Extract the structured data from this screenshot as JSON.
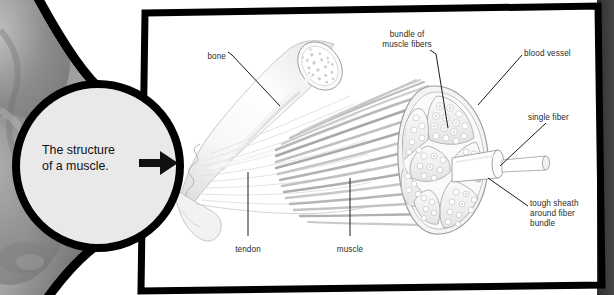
{
  "page": {
    "title": "The structure of a muscle",
    "width": 614,
    "height": 295
  },
  "callout": {
    "text": "The structure\nof a muscle.",
    "arrow_icon": "arrow-right-icon",
    "fill": "#e9e9e9",
    "stroke": "#000000"
  },
  "photo": {
    "alt": "greyscale body photograph",
    "base": "#8e8e8e"
  },
  "frame": {
    "border_color": "#000000",
    "fill": "#ffffff",
    "side_band": "#3c3c3c"
  },
  "diagram": {
    "name": "muscle-anatomy-diagram",
    "labels": [
      {
        "id": "bone",
        "text": "bone",
        "x": 190,
        "y": 52,
        "w": 36,
        "align": "r"
      },
      {
        "id": "bundle",
        "text": "bundle of\nmuscle fibers",
        "x": 368,
        "y": 30,
        "w": 78,
        "align": "c"
      },
      {
        "id": "blood-vessel",
        "text": "blood vessel",
        "x": 524,
        "y": 49,
        "w": 64,
        "align": "l"
      },
      {
        "id": "single-fiber",
        "text": "single fiber",
        "x": 528,
        "y": 113,
        "w": 60,
        "align": "l"
      },
      {
        "id": "tough-sheath",
        "text": "tough sheath\naround fiber\nbundle",
        "x": 530,
        "y": 199,
        "w": 66,
        "align": "l"
      },
      {
        "id": "tendon",
        "text": "tendon",
        "x": 226,
        "y": 245,
        "w": 44,
        "align": "c"
      },
      {
        "id": "muscle",
        "text": "muscle",
        "x": 328,
        "y": 245,
        "w": 44,
        "align": "c"
      }
    ],
    "parts": {
      "bone": "bone with cut cross-section",
      "tendon": "tendon fibers fanning out",
      "muscle": "muscle belly with striated fibers",
      "cross_section": "muscle cross-section with fiber bundles",
      "single_fiber": "protruding single fiber cylinder"
    },
    "colors": {
      "leader_line": "#1d1d1d",
      "outline": "#9a9a9a",
      "fiber": "#b4b4b4",
      "light": "#f2f2f2"
    }
  }
}
